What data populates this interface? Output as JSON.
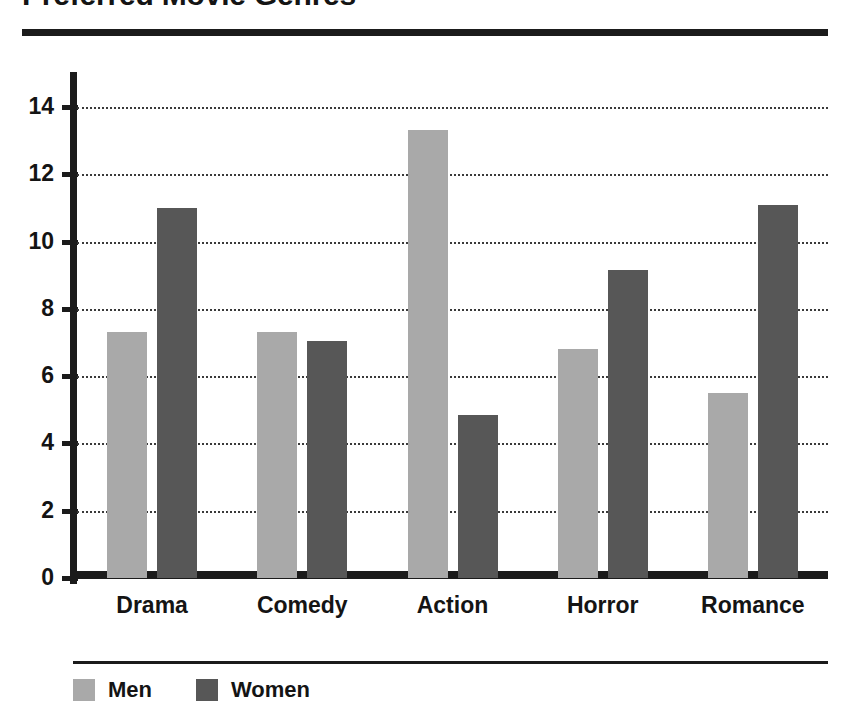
{
  "chart_data": {
    "type": "bar",
    "title": "Preferred Movie Genres",
    "xlabel": "",
    "ylabel": "",
    "categories": [
      "Drama",
      "Comedy",
      "Action",
      "Horror",
      "Romance"
    ],
    "series": [
      {
        "name": "Men",
        "color": "#a9a9a9",
        "values": [
          7.3,
          7.3,
          13.3,
          6.8,
          5.5
        ]
      },
      {
        "name": "Women",
        "color": "#575757",
        "values": [
          11.0,
          7.05,
          4.85,
          9.15,
          11.1
        ]
      }
    ],
    "ylim": [
      0,
      15.2
    ],
    "yticks": [
      0,
      2,
      4,
      6,
      8,
      10,
      12,
      14
    ],
    "ytick_labels": [
      "0",
      "2",
      "4",
      "6",
      "8",
      "10",
      "12",
      "14"
    ],
    "grid": true,
    "grid_style": "dotted",
    "legend_position": "bottom-left",
    "orientation": "vertical",
    "grouping": "grouped"
  },
  "legend": {
    "items": [
      {
        "label": "Men",
        "swatch": "men-swatch"
      },
      {
        "label": "Women",
        "swatch": "women-swatch"
      }
    ]
  },
  "colors": {
    "men": "#a9a9a9",
    "women": "#575757",
    "axis": "#1b1b1b",
    "text": "#141414",
    "grid": "#3a3a3a",
    "background": "#ffffff"
  }
}
